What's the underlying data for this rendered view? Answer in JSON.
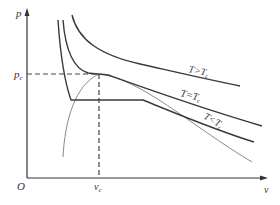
{
  "diagram": {
    "axes": {
      "y_label": "p",
      "x_label": "v",
      "origin_label": "O",
      "critical_pressure_label": "p",
      "critical_pressure_subscript": "c",
      "critical_volume_label": "v",
      "critical_volume_subscript": "c"
    },
    "curves": [
      {
        "label": "T>T",
        "subscript": "c",
        "name": "isotherm-above-critical"
      },
      {
        "label": "T=T",
        "subscript": "c",
        "name": "isotherm-critical"
      },
      {
        "label": "T<T",
        "subscript": "c",
        "name": "isotherm-below-critical"
      }
    ],
    "colors": {
      "axis": "#333333",
      "isotherm": "#3a3a3a",
      "coexistence": "#8a8a8a",
      "dashed": "#444444"
    }
  }
}
